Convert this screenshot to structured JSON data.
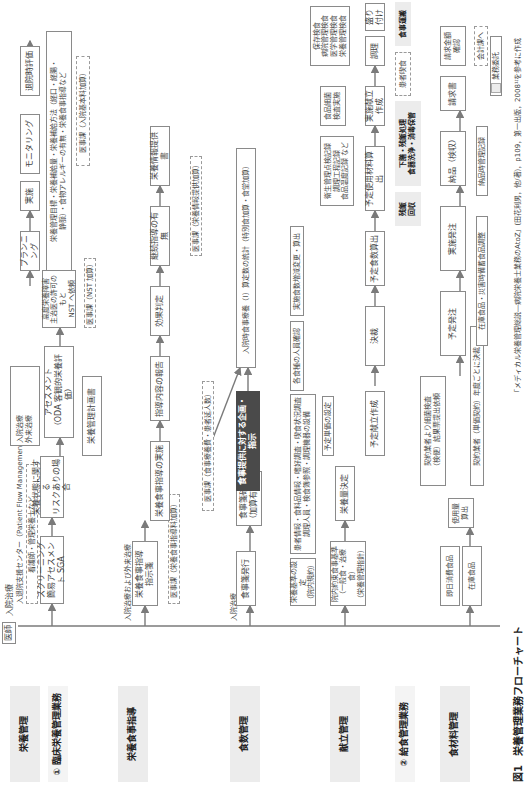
{
  "figure": {
    "caption_label": "図1",
    "caption_title": "栄養管理業務フローチャート",
    "source": "「メディカル栄養管理総説―病院栄養士業務のAtoZ」(田花利男，他/著)，p109，第一出版，2008¹⁾を参考に作成"
  },
  "legend": {
    "inpatient": "入院治療",
    "outpatient": "外来治療",
    "outsourced": "業務委託"
  },
  "categories": {
    "clinical": "① 臨床栄養管理業務",
    "foodservice": "② 給食管理業務",
    "nutrition_mgmt": "栄養管理",
    "nutrition_guidance": "栄養食事指導",
    "meal_mgmt": "食数管理",
    "menu_mgmt": "献立管理",
    "ingredient_mgmt": "食材料管理"
  },
  "labels": {
    "doctor": "医師",
    "inpatient_treatment": "入院治療",
    "admission_center": "入退院支援センター（Patient Flow Management：PFM）",
    "nurse_etc": "看護師・管理栄養士など",
    "in_and_out": "入院治療および外来治療",
    "inpatient_treatment2": "入院治療"
  },
  "boxes": {
    "screening": "スクリーニング\n簡易アセスメント SGA",
    "risk": "栄養状態に関する\nリスクありの場合",
    "assessment": "アセスメント\n（ODA 客観的栄養評価）",
    "high_risk": "高度栄養障害\n主治医の許可のもと\nNST へ依頼",
    "nst_fee": "医事課（NST 加算）",
    "plan_doc": "栄養管理計画書",
    "planning": "プランニング",
    "planning_detail": "栄養管理目標・栄養補給量・栄養補給方法（経口・経腸・\n静脈）・食物アレルギーの有無・栄養食事指導など",
    "implement": "実施",
    "monitoring": "モニタリング",
    "discharge_eval": "退院時評価",
    "hospital_fee": "医事課（入院基本料加算）",
    "guidance_order": "栄養食事指導\n指示箋",
    "guidance_fee": "医事課（栄養食事指導料加算）",
    "guidance_exec": "栄養食事指導の実施",
    "guidance_report": "指導内容の報告",
    "effect": "効果判定",
    "continue": "継続指導の有無",
    "info_doc": "栄養情報提供書",
    "info_fee": "医事課（栄養情報提供加算）",
    "meal_order": "食事箋発行",
    "meal_confirm": "食事箋確認\n（加算有無）",
    "meal_fee": "医事課（食事療養費・患者延人数）",
    "meal_plan": "食事提供に対する企画・指示",
    "meal_cost": "入院時食事療養（I）算定数の統計（特別食加算・食堂加算）",
    "nutrition_std": "栄養基準の設定\n（院内規約）",
    "patient_info": "患者情報・食料品情報・嗜好調査・喫食状況調査\n調理人員・検食簿参照・調理機器の設備",
    "each_staff": "各食種の人員確認",
    "actual_count": "実施食数増減変更・算出",
    "menu_std": "院内約束食事基準\n（一般食・治療食）\n（栄養管理指針）",
    "nutrient_decision": "栄養量決定",
    "unit_price": "予定単価の設定",
    "planned_menu": "予定献立作成",
    "approval": "決裁",
    "planned_count": "予定食数算出",
    "planned_material": "予定使用材料算出",
    "actual_menu": "実施献立作成",
    "hygiene_records": "衛生管理点検記録\n調理工程記録\n食品温度記録 など",
    "bacteria": "食品細菌\n検査実施",
    "cooking": "調理",
    "plating": "盛り付け",
    "preserve": "保存検食\n病院管理検食\n医学管理検食\n栄養管理検食",
    "delivery": "食事運搬",
    "eating": "患者喫食",
    "cleanup": "下膳・残飯処理\n食器洗浄・消毒保管",
    "leftovers": "残飯\n回収",
    "same_day": "即日消費食品",
    "stock": "在庫食品",
    "usage": "使用量算出",
    "contractor_test": "契約業者より細菌検査\n（検便）結果票提出依頼",
    "contract_annual": "契約業者（単価契約）年度ごとに決裁",
    "planned_order": "予定発注",
    "actual_order": "実施発注",
    "receive": "納品（検収）",
    "invoice": "請求書",
    "amount_check": "請求金額\n確認",
    "accounting": "会計課へ",
    "stock_adjust": "在庫食品・災害時備蓄食品調整",
    "receive_record": "納品時管理記録"
  }
}
